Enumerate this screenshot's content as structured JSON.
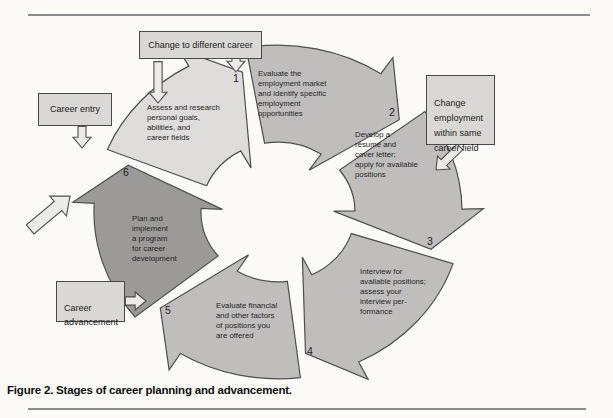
{
  "figure": {
    "caption": "Figure 2. Stages of career planning and advancement."
  },
  "colors": {
    "background": "#fbfaf7",
    "arrow_light": "#dedddb",
    "arrow_mid": "#bfbebc",
    "arrow_dark": "#9b9a98",
    "arrow_outline": "#4f4f4f",
    "callout_fill": "#d9d8d4",
    "callout_border": "#4a4a4a",
    "pointer_fill": "#edebe7",
    "rule": "#8c8c8c"
  },
  "callouts": {
    "change_different_career": {
      "label": "Change to different career"
    },
    "career_entry": {
      "label": "Career entry"
    },
    "change_same_field": {
      "label": "Change\nemployment\nwithin same\ncareer field"
    },
    "career_advancement": {
      "label": "Career\nadvancement"
    }
  },
  "steps": [
    {
      "number": "1",
      "label": "Assess and research\npersonal goals,\nabilities, and\ncareer fields"
    },
    {
      "number": "2",
      "label": "Evaluate the\nemployment market\nand identify specific\nemployment\nopportunities"
    },
    {
      "number": "3",
      "label": "Develop a\nrésumé and\ncover letter;\napply for available\npositions"
    },
    {
      "number": "4",
      "label": "Interview for\navailable positions;\nassess your\ninterview per-\nformance"
    },
    {
      "number": "5",
      "label": "Evaluate financial\nand other factors\nof positions you\nare offered"
    },
    {
      "number": "6",
      "label": "Plan and\nimplement\na program\nfor career\ndevelopment"
    }
  ]
}
